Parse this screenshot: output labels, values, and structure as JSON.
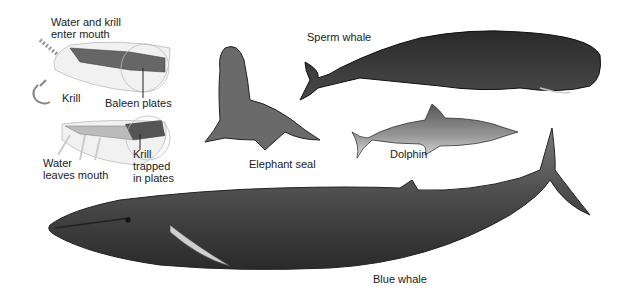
{
  "figure": {
    "labels": {
      "water_krill_enter": "Water and krill\nenter mouth",
      "krill": "Krill",
      "baleen_plates": "Baleen plates",
      "water_leaves": "Water\nleaves mouth",
      "krill_trapped": "Krill\ntrapped\nin plates",
      "elephant_seal": "Elephant seal",
      "sperm_whale": "Sperm whale",
      "dolphin": "Dolphin",
      "blue_whale": "Blue whale"
    },
    "animals": [
      "Elephant seal",
      "Sperm whale",
      "Dolphin",
      "Blue whale"
    ],
    "icons": [
      "krill-icon",
      "baleen-mouth-open-diagram",
      "baleen-mouth-closed-diagram"
    ]
  }
}
